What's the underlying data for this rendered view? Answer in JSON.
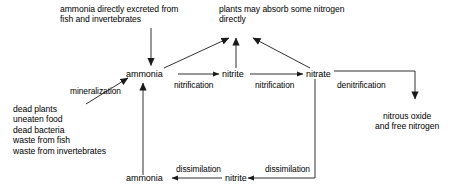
{
  "diagram": {
    "type": "flow-diagram",
    "background_color": "#ffffff",
    "stroke_color": "#1a1a1a",
    "nodes": {
      "excreted_ammonia": "ammonia directly excreted from\nfish and invertebrates",
      "plants_absorb": "plants may absorb some nitrogen\ndirectly",
      "ammonia_main": "ammonia",
      "nitrite_main": "nitrite",
      "nitrate_main": "nitrate",
      "nitrous_oxide": "nitrous oxide\nand free nitrogen",
      "organic_sources": "dead plants\nuneaten food\ndead bacteria\nwaste from fish\nwaste from invertebrates",
      "ammonia_bottom": "ammonia",
      "nitrite_bottom": "nitrite"
    },
    "edge_labels": {
      "mineralization": "mineralization",
      "nitrification_1": "nitrification",
      "nitrification_2": "nitrification",
      "denitrification": "denitrification",
      "dissimilation_1": "dissimilation",
      "dissimilation_2": "dissimilation"
    }
  }
}
